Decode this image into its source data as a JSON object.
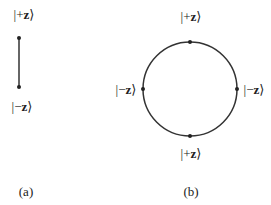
{
  "panel_a": {
    "caption": "(a)",
    "top_label": {
      "bar": "|",
      "sign": "+",
      "var": "z",
      "close": "⟩"
    },
    "bottom_label": {
      "bar": "|",
      "sign": "−",
      "var": "z",
      "close": "⟩"
    }
  },
  "panel_b": {
    "caption": "(b)",
    "top_label": {
      "bar": "|",
      "sign": "+",
      "var": "z",
      "close": "⟩"
    },
    "bottom_label": {
      "bar": "|",
      "sign": "+",
      "var": "z",
      "close": "⟩"
    },
    "left_label": {
      "bar": "|",
      "sign": "−",
      "var": "z",
      "close": "⟩"
    },
    "right_label": {
      "bar": "|",
      "sign": "−",
      "var": "z",
      "close": "⟩"
    }
  },
  "colors": {
    "stroke": "#333333",
    "text": "#222222"
  }
}
